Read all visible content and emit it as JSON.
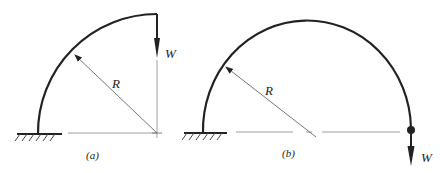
{
  "figure": {
    "panels": [
      {
        "id": "a",
        "caption": "(a)",
        "radius_label": "R",
        "load_label": "W",
        "description": "Quarter-circle arc fixed at left base, load W downward at top free end"
      },
      {
        "id": "b",
        "caption": "(b)",
        "radius_label": "R",
        "load_label": "W",
        "description": "Semicircular arc fixed at left base, load W downward at right free end"
      }
    ],
    "colors": {
      "stroke": "#222222",
      "thin": "#666666"
    }
  }
}
